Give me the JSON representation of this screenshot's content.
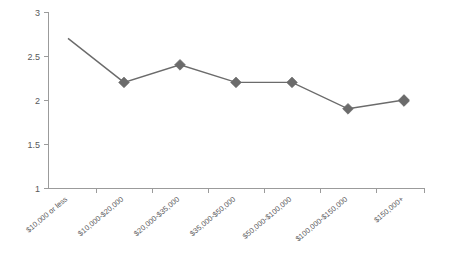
{
  "chart_data": {
    "type": "line",
    "title": "",
    "subtitle": "",
    "xlabel": "",
    "ylabel": "",
    "categories": [
      "$10,000 or less",
      "$10,000-$20,000",
      "$20,000-$35,000",
      "$35,000-$50,000",
      "$50,000-$100,000",
      "$100,000-$150,000",
      "$150,000+"
    ],
    "values": [
      2.7,
      2.2,
      2.4,
      2.2,
      2.2,
      1.9,
      2.0
    ],
    "ylim": [
      1,
      3
    ],
    "yticks": [
      1,
      1.5,
      2,
      2.5,
      3
    ],
    "ytick_labels": [
      "1",
      "1.5",
      "2",
      "2.5",
      "3"
    ],
    "grid": false,
    "legend": false,
    "legend_position": "none",
    "marker": "diamond",
    "series_color": "#6b6b6b",
    "axis_color": "#9b9b9b",
    "label_color": "#58585a",
    "background_color": "#ffffff",
    "xtick_label_rotation": -40
  }
}
